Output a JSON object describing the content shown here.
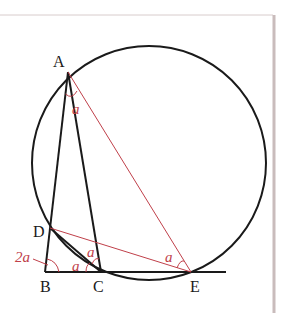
{
  "colors": {
    "stroke": "#1a1a1a",
    "accent": "#c0404a",
    "frame": "#c9bcbc"
  },
  "points": {
    "A": {
      "label": "A",
      "x": 68,
      "y": 72
    },
    "B": {
      "label": "B",
      "x": 45,
      "y": 272
    },
    "C": {
      "label": "C",
      "x": 101,
      "y": 272
    },
    "D": {
      "label": "D",
      "x": 50,
      "y": 228
    },
    "E": {
      "label": "E",
      "x": 191,
      "y": 272
    }
  },
  "circle": {
    "cx": 149,
    "cy": 163,
    "r": 117
  },
  "angle_labels": {
    "at_A": "a",
    "at_B": "2a",
    "at_C_lower": "a",
    "at_C_upper": "a",
    "at_E": "a"
  }
}
